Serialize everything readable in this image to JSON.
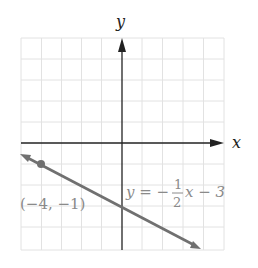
{
  "axes": {
    "x_label": "x",
    "y_label": "y",
    "x_range": [
      -5,
      5
    ],
    "y_range": [
      -5,
      5
    ]
  },
  "line": {
    "equation_prefix": "y = −",
    "fraction_num": "1",
    "fraction_den": "2",
    "equation_suffix": "x − 3",
    "slope": -0.5,
    "intercept": -3,
    "color": "#707070"
  },
  "point": {
    "label": "(−4, −1)",
    "x": -4,
    "y": -1
  },
  "colors": {
    "axis": "#222222",
    "grid": "#e4e4e4",
    "label_gray": "#8a8a8a"
  }
}
